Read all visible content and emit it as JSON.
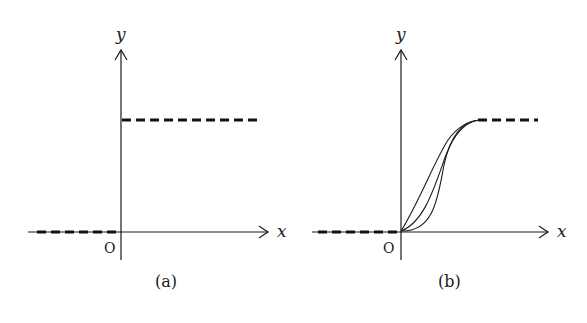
{
  "figure": {
    "panels": [
      {
        "id": "a",
        "caption": "(a)",
        "x_axis_label": "x",
        "y_axis_label": "y",
        "origin_label": "O",
        "description": "Step function: dashed line at y=0 for x<0 and dashed line at y=1 for x>0"
      },
      {
        "id": "b",
        "caption": "(b)",
        "x_axis_label": "x",
        "y_axis_label": "y",
        "origin_label": "O",
        "description": "Smooth transition: three S-shaped curves rising from origin to level 1, dashed line at y=0 for x<0 and dashed continuation at y=1 after the curves"
      }
    ],
    "colors": {
      "line": "#1a1a1a",
      "background": "#ffffff"
    }
  }
}
